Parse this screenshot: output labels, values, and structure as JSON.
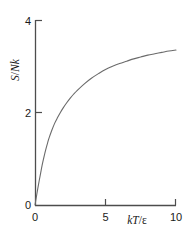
{
  "chart_data": {
    "type": "line",
    "title": "",
    "subtitle": "",
    "xlabel": "kT/ε",
    "ylabel": "S/Nk",
    "xlabel_parts": {
      "k": "k",
      "T": "T",
      "slash": "/",
      "eps": "ε"
    },
    "ylabel_parts": {
      "S": "S",
      "slash": "/",
      "N": "N",
      "k": "k"
    },
    "xlim": [
      0,
      10
    ],
    "ylim": [
      0,
      4
    ],
    "xticks": [
      0,
      5,
      10
    ],
    "yticks": [
      0,
      2,
      4
    ],
    "xticklabels": [
      "0",
      "5",
      "10"
    ],
    "yticklabels": [
      "0",
      "2",
      "4"
    ],
    "grid": false,
    "legend": null,
    "series": [
      {
        "name": "S/Nk vs kT/ε",
        "color": "#6b6b6b",
        "linewidth": 1.1,
        "x": [
          0.0,
          0.1,
          0.2,
          0.3,
          0.4,
          0.5,
          0.6,
          0.7,
          0.8,
          0.9,
          1.0,
          1.2,
          1.4,
          1.6,
          1.8,
          2.0,
          2.25,
          2.5,
          2.75,
          3.0,
          3.5,
          4.0,
          4.5,
          5.0,
          5.5,
          6.0,
          6.5,
          7.0,
          7.5,
          8.0,
          8.5,
          9.0,
          9.5,
          10.0
        ],
        "y": [
          0.0,
          0.18,
          0.36,
          0.53,
          0.69,
          0.85,
          0.99,
          1.12,
          1.24,
          1.35,
          1.45,
          1.62,
          1.77,
          1.89,
          2.0,
          2.1,
          2.21,
          2.31,
          2.4,
          2.48,
          2.62,
          2.74,
          2.84,
          2.93,
          3.0,
          3.06,
          3.11,
          3.16,
          3.2,
          3.24,
          3.27,
          3.3,
          3.33,
          3.35
        ]
      }
    ],
    "endpoint": {
      "x": 10,
      "y": 3.35
    },
    "axis_color": "#4d4d4d",
    "background": "#ffffff"
  },
  "figure": {
    "name": "entropy-vs-temperature-plot"
  }
}
